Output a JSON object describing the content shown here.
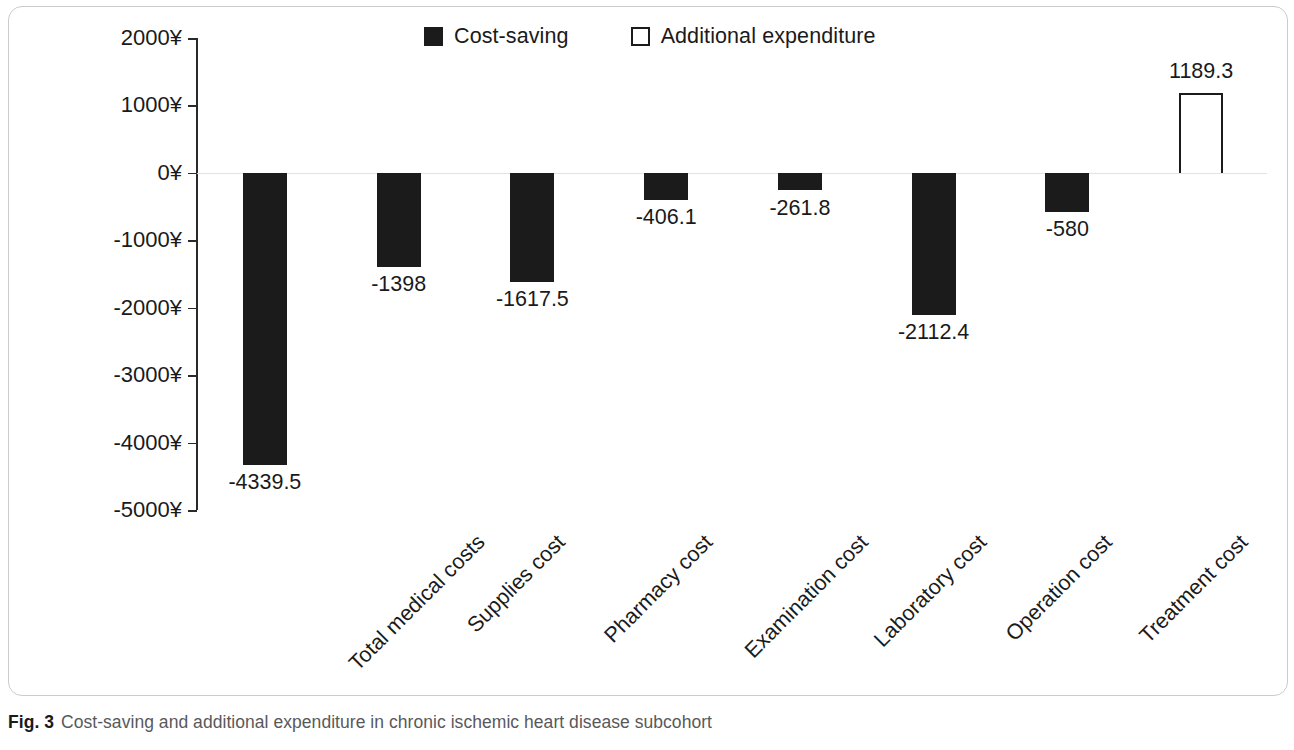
{
  "caption": {
    "figure_number": "Fig. 3",
    "text": "Cost-saving and additional expenditure in chronic ischemic heart disease subcohort"
  },
  "legend": {
    "items": [
      {
        "label": "Cost-saving",
        "swatch": "filled-square-icon",
        "color": "#1b1b1b"
      },
      {
        "label": "Additional expenditure",
        "swatch": "hollow-square-icon",
        "color": "#ffffff"
      }
    ]
  },
  "axis": {
    "y_ticks": [
      "2000¥",
      "1000¥",
      "0¥",
      "-1000¥",
      "-2000¥",
      "-3000¥",
      "-4000¥",
      "-5000¥"
    ]
  },
  "chart_data": {
    "type": "bar",
    "title": "",
    "subtitle": "",
    "xlabel": "",
    "ylabel": "",
    "ylim": [
      -5000,
      2000
    ],
    "ytick_step": 1000,
    "ytick_suffix": "¥",
    "grid": false,
    "legend_position": "top-center",
    "categories": [
      "Total medical costs",
      "Supplies cost",
      "Pharmacy cost",
      "Examination cost",
      "Laboratory cost",
      "Operation cost",
      "Treatment cost",
      "Chinese patent drug cost"
    ],
    "values": [
      -4339.5,
      -1398,
      -1617.5,
      -406.1,
      -261.8,
      -2112.4,
      -580,
      1189.3
    ],
    "value_labels": [
      "-4339.5",
      "-1398",
      "-1617.5",
      "-406.1",
      "-261.8",
      "-2112.4",
      "-580",
      "1189.3"
    ],
    "series": [
      {
        "name": "Cost-saving",
        "values": [
          -4339.5,
          -1398,
          -1617.5,
          -406.1,
          -261.8,
          -2112.4,
          -580,
          null
        ]
      },
      {
        "name": "Additional expenditure",
        "values": [
          null,
          null,
          null,
          null,
          null,
          null,
          null,
          1189.3
        ]
      }
    ]
  }
}
